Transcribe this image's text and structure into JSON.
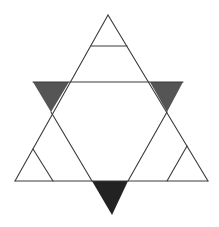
{
  "diagram": {
    "title": "",
    "colors": {
      "background": "#ffffff",
      "line": "#3a3a3a",
      "shade_side": "#555555",
      "shade_bottom": "#222222"
    },
    "lines": [
      {
        "id": "up-left-side",
        "x1": 108,
        "y1": 15,
        "x2": 15,
        "y2": 181
      },
      {
        "id": "up-right-side",
        "x1": 108,
        "y1": 15,
        "x2": 208,
        "y2": 181
      },
      {
        "id": "up-base",
        "x1": 15,
        "y1": 181,
        "x2": 208,
        "y2": 181
      },
      {
        "id": "top-inner-horizontal",
        "x1": 91,
        "y1": 46,
        "x2": 127,
        "y2": 46
      },
      {
        "id": "middle-horizontal",
        "x1": 33,
        "y1": 82,
        "x2": 183,
        "y2": 82
      },
      {
        "id": "down-left-side-lower",
        "x1": 51,
        "y1": 112,
        "x2": 92,
        "y2": 181
      },
      {
        "id": "down-right-side-lower",
        "x1": 167,
        "y1": 112,
        "x2": 128,
        "y2": 181
      },
      {
        "id": "bottom-left-inner",
        "x1": 33,
        "y1": 149,
        "x2": 53,
        "y2": 181
      },
      {
        "id": "bottom-right-inner",
        "x1": 187,
        "y1": 146,
        "x2": 167,
        "y2": 181
      }
    ],
    "shaded_triangles": [
      {
        "id": "left-shaded",
        "points": "33,82 69,82 51,112",
        "fill": "#555555"
      },
      {
        "id": "right-shaded",
        "points": "150,82 183,82 167,112",
        "fill": "#555555"
      },
      {
        "id": "bottom-shaded",
        "points": "92,181 128,181 112,215",
        "fill": "#222222"
      }
    ]
  }
}
